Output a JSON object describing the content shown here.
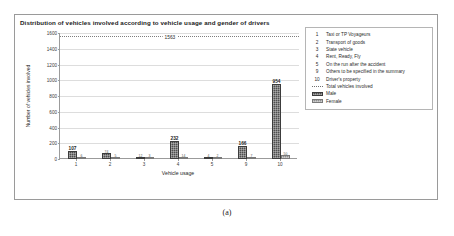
{
  "figure": {
    "caption": "(a)"
  },
  "chart_data": {
    "type": "bar",
    "title": "Distribution of vehicles involved according to vehicle usage and gender of drivers",
    "xlabel": "Vehicle usage",
    "ylabel": "Number of vehicles involved",
    "ylim": [
      0,
      1600
    ],
    "ytick_labels": [
      "0",
      "200",
      "400",
      "600",
      "800",
      "1000",
      "1200",
      "1400",
      "1600"
    ],
    "yticks": [
      0,
      200,
      400,
      600,
      800,
      1000,
      1200,
      1400,
      1600
    ],
    "grid": true,
    "legend_position": "right",
    "categories": [
      "1",
      "2",
      "3",
      "4",
      "5",
      "9",
      "10"
    ],
    "series": [
      {
        "name": "Male",
        "values": [
          107,
          74,
          12,
          232,
          4,
          166,
          954
        ],
        "color": "#4f4f4f",
        "labels": [
          "107",
          "74",
          "12",
          "232",
          "4",
          "166",
          "954"
        ]
      },
      {
        "name": "Female",
        "values": [
          6,
          5,
          3,
          14,
          2,
          7,
          50
        ],
        "color": "#8f8f8f",
        "labels": [
          "6",
          "5",
          "3",
          "14",
          "2",
          "7",
          "50"
        ]
      }
    ],
    "reference_line": {
      "name": "Total vehicles involved",
      "value": 1563,
      "label": "1563",
      "style": "dotted"
    },
    "annotations": [
      "107",
      "74",
      "232",
      "166",
      "954",
      "50",
      "1563"
    ]
  },
  "legend": {
    "codes": [
      {
        "key": "1",
        "label": "Taxi or TP Voyageurs"
      },
      {
        "key": "2",
        "label": "Transport of goods"
      },
      {
        "key": "3",
        "label": "State vehicle"
      },
      {
        "key": "4",
        "label": "Rent, Ready, Fly"
      },
      {
        "key": "5",
        "label": "On the run after the accident"
      },
      {
        "key": "9",
        "label": "Others to be specified in the summary"
      },
      {
        "key": "10",
        "label": "Driver's property"
      }
    ],
    "series": [
      {
        "swatch": "dotted-line",
        "label": "Total vehicles involved"
      },
      {
        "swatch": "male-bar",
        "label": "Male"
      },
      {
        "swatch": "female-bar",
        "label": "Female"
      }
    ]
  }
}
